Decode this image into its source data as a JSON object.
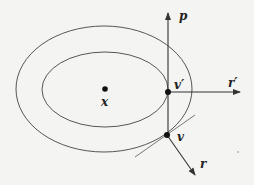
{
  "diagram": {
    "labels": {
      "center": "x",
      "p": "p",
      "v_prime": "v′",
      "r_prime": "r′",
      "v": "v",
      "r": "r"
    },
    "colors": {
      "stroke": "#333333",
      "background": "#f4f4f2"
    }
  }
}
